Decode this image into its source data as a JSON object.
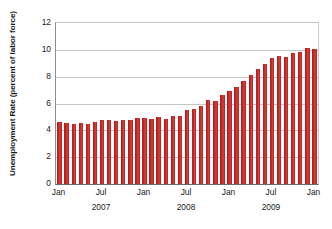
{
  "chart_data": {
    "type": "bar",
    "title": "",
    "xlabel": "",
    "ylabel": "Unemployment Rate (percent of labor force)",
    "ylim": [
      0,
      12
    ],
    "yticks": [
      0,
      2,
      4,
      6,
      8,
      10,
      12
    ],
    "ytick_labels": [
      "0",
      "2",
      "4",
      "6",
      "8",
      "10",
      "12"
    ],
    "grid": true,
    "legend": "none",
    "bar_color": "#b51f1f",
    "xtick_labels": [
      "Jan",
      "Jul",
      "Jan",
      "Jul",
      "Jan",
      "Jul",
      "Jan"
    ],
    "xtick_months": [
      "2007-01",
      "2007-07",
      "2008-01",
      "2008-07",
      "2009-01",
      "2009-07",
      "2010-01"
    ],
    "year_labels": [
      "2007",
      "2008",
      "2009"
    ],
    "year_positions": [
      "2007-07",
      "2008-07",
      "2009-07"
    ],
    "categories": [
      "2007-01",
      "2007-02",
      "2007-03",
      "2007-04",
      "2007-05",
      "2007-06",
      "2007-07",
      "2007-08",
      "2007-09",
      "2007-10",
      "2007-11",
      "2007-12",
      "2008-01",
      "2008-02",
      "2008-03",
      "2008-04",
      "2008-05",
      "2008-06",
      "2008-07",
      "2008-08",
      "2008-09",
      "2008-10",
      "2008-11",
      "2008-12",
      "2009-01",
      "2009-02",
      "2009-03",
      "2009-04",
      "2009-05",
      "2009-06",
      "2009-07",
      "2009-08",
      "2009-09",
      "2009-10",
      "2009-11",
      "2009-12",
      "2010-01"
    ],
    "values": [
      4.65,
      4.55,
      4.5,
      4.55,
      4.5,
      4.6,
      4.75,
      4.75,
      4.7,
      4.75,
      4.75,
      4.9,
      4.95,
      4.85,
      5.0,
      4.85,
      5.05,
      5.1,
      5.55,
      5.6,
      5.85,
      6.25,
      6.2,
      6.6,
      6.9,
      7.2,
      7.65,
      8.15,
      8.55,
      8.95,
      9.4,
      9.55,
      9.5,
      9.75,
      9.85,
      10.15,
      10.05
    ]
  }
}
